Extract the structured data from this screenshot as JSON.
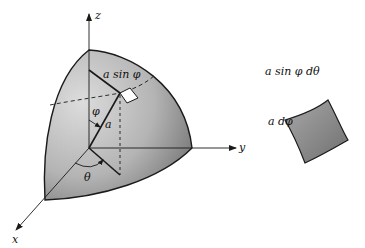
{
  "figure": {
    "axes": {
      "z_label": "z",
      "y_label": "y",
      "x_label": "x"
    },
    "labels": {
      "radius": "a",
      "polar_angle": "φ",
      "azimuth_angle": "θ",
      "arc_radius": "a sin φ"
    },
    "element": {
      "top_edge": "a sin φ dθ",
      "side_edge": "a dφ"
    },
    "colors": {
      "surface_light": "#d6d6d6",
      "surface_dark": "#7a7a7a",
      "line": "#1a1a1a",
      "patch": "#ffffff"
    }
  }
}
